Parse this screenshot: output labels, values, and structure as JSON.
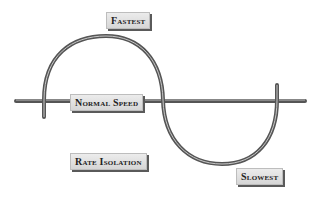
{
  "diagram": {
    "labels": {
      "fastest": "Fastest",
      "normal_speed": "Normal Speed",
      "rate_isolation": "Rate Isolation",
      "slowest": "Slowest"
    },
    "colors": {
      "curve": "#555555",
      "label_bg": "#e2e2e2",
      "label_shadow": "#5a5a5a"
    }
  }
}
